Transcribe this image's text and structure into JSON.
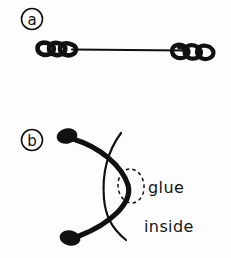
{
  "figure": {
    "background_color": "#fdfdfd",
    "ink_color": "#111111",
    "width": 231,
    "height": 258
  },
  "panels": [
    {
      "id": "a",
      "label": "a",
      "label_style": "circled-letter",
      "description": "Straight wire with tight helical coils at both ends",
      "elements": {
        "left_coil_label": "left-coil",
        "shaft_label": "straight-shaft",
        "right_coil_label": "right-coil",
        "left_coil_turns": 3,
        "right_coil_turns": 3
      }
    },
    {
      "id": "b",
      "label": "b",
      "label_style": "circled-letter",
      "description": "Bowed thick arc with two blob tips crossed by a thin arc; glue region circled",
      "annotations": [
        {
          "name": "glue",
          "text": "glue",
          "marker": "dashed-ellipse"
        },
        {
          "name": "inside",
          "text": "inside",
          "marker": "none"
        }
      ],
      "elements": {
        "thick_arc_label": "thick-bowed-arc",
        "thin_arc_label": "thin-crossing-arc",
        "top_blob_label": "top-end-blob",
        "bottom_blob_label": "bottom-end-blob",
        "glue_ellipse_label": "glue-dashed-ellipse"
      }
    }
  ]
}
